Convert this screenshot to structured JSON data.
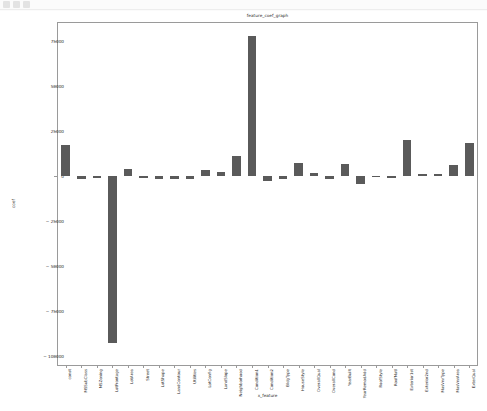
{
  "toolbar": {
    "icons": [
      "save-icon",
      "zoom-icon",
      "pan-icon"
    ]
  },
  "chart_data": {
    "type": "bar",
    "title": "feature_coef_graph",
    "xlabel": "x_feature",
    "ylabel": "coef",
    "ylim": [
      -105000,
      85000
    ],
    "yticks": [
      75000,
      50000,
      25000,
      0,
      -25000,
      -50000,
      -75000,
      -100000
    ],
    "ytick_labels": [
      "75000",
      "50000",
      "25000",
      "0",
      "− 25000",
      "− 50000",
      "− 75000",
      "− 100000"
    ],
    "grid": false,
    "legend": null,
    "bar_color": "#5a5a5a",
    "categories": [
      "const",
      "MSSubClass",
      "MSZoning",
      "LotFrontage",
      "LotArea",
      "Street",
      "LotShape",
      "LandContour",
      "Utilities",
      "LotConfig",
      "LandSlope",
      "Neighborhood",
      "Condition1",
      "Condition2",
      "BldgType",
      "HouseStyle",
      "OverallQual",
      "OverallCond",
      "YearBuilt",
      "YearRemodAdd",
      "RoofStyle",
      "RoofMatl",
      "Exterior1st",
      "Exterior2nd",
      "MasVnrType",
      "MasVnrArea",
      "ExterQual"
    ],
    "values": [
      17000,
      -1500,
      -1000,
      -93000,
      4000,
      -1200,
      -1500,
      -1800,
      -1500,
      3500,
      2500,
      11000,
      78000,
      -3000,
      -1500,
      7000,
      1500,
      -1500,
      6500,
      -4500,
      -800,
      -1200,
      20000,
      1200,
      1000,
      6000,
      18500
    ]
  }
}
